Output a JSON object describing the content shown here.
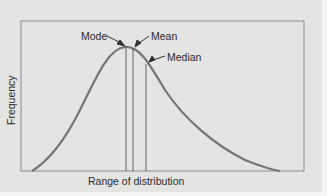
{
  "diagram": {
    "type": "skewed-distribution",
    "y_axis_label": "Frequency",
    "x_axis_label": "Range of distribution",
    "annotations": {
      "mode": "Mode",
      "mean": "Mean",
      "median": "Median"
    },
    "colors": {
      "background": "#e4e4e2",
      "curve": "#707070",
      "frame": "#8a8a8a",
      "lines": "#606060"
    }
  }
}
